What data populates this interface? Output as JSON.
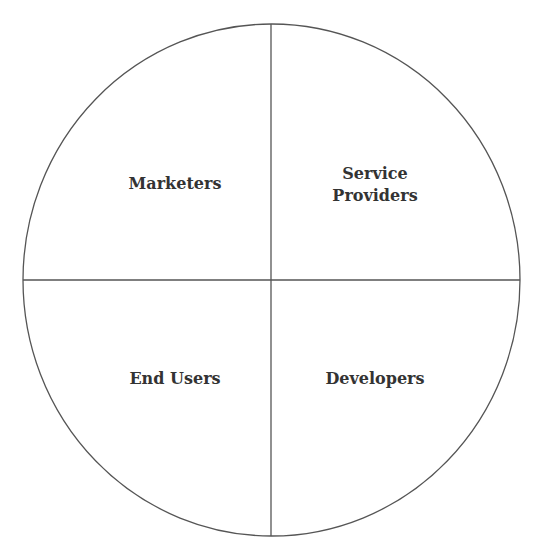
{
  "diagram": {
    "type": "quadrant-circle",
    "stroke_color": "#555555",
    "quadrants": [
      {
        "position": "top-left",
        "label": "Marketers"
      },
      {
        "position": "top-right",
        "label": "Service\nProviders"
      },
      {
        "position": "bottom-left",
        "label": "End Users"
      },
      {
        "position": "bottom-right",
        "label": "Developers"
      }
    ]
  }
}
